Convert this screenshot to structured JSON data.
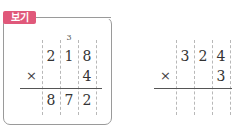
{
  "example": {
    "badge_label": "보기",
    "badge_color": "#e0587a",
    "carry": "3",
    "multiplicand": [
      "2",
      "1",
      "8"
    ],
    "operator": "×",
    "multiplier": "4",
    "product": [
      "8",
      "7",
      "2"
    ]
  },
  "exercise": {
    "multiplicand": [
      "3",
      "2",
      "4"
    ],
    "operator": "×",
    "multiplier": "3",
    "product": [
      "",
      "",
      ""
    ]
  }
}
